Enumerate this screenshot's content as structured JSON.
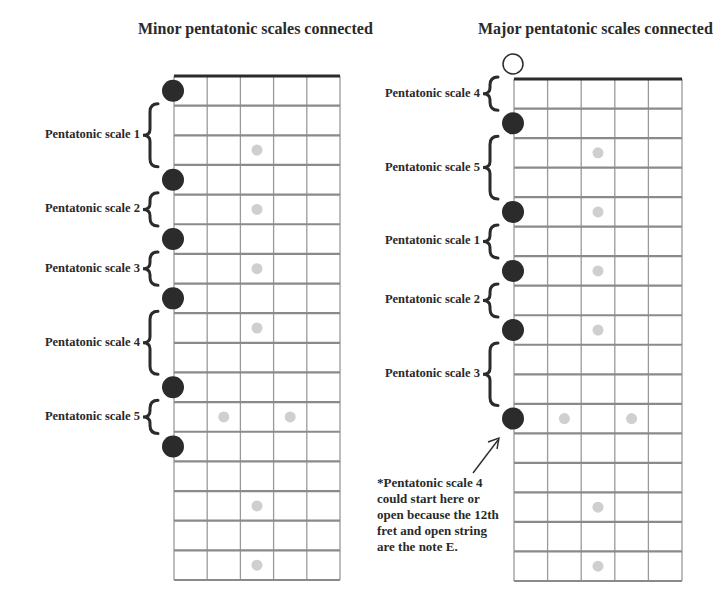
{
  "minor": {
    "title": "Minor pentatonic scales connected",
    "labels": [
      {
        "text": "Pentatonic scale 1",
        "from_fret": 1,
        "to_fret": 4
      },
      {
        "text": "Pentatonic scale 2",
        "from_fret": 4,
        "to_fret": 6
      },
      {
        "text": "Pentatonic scale 3",
        "from_fret": 6,
        "to_fret": 8
      },
      {
        "text": "Pentatonic scale 4",
        "from_fret": 8,
        "to_fret": 11
      },
      {
        "text": "Pentatonic scale 5",
        "from_fret": 11,
        "to_fret": 13
      }
    ],
    "root_frets": [
      1,
      4,
      6,
      8,
      11,
      13
    ],
    "open_root": false
  },
  "major": {
    "title": "Major pentatonic scales connected",
    "labels": [
      {
        "text": "Pentatonic scale 4",
        "from_fret": 0,
        "to_fret": 2
      },
      {
        "text": "Pentatonic scale 5",
        "from_fret": 2,
        "to_fret": 5
      },
      {
        "text": "Pentatonic scale 1",
        "from_fret": 5,
        "to_fret": 7
      },
      {
        "text": "Pentatonic scale 2",
        "from_fret": 7,
        "to_fret": 9
      },
      {
        "text": "Pentatonic scale 3",
        "from_fret": 9,
        "to_fret": 12
      }
    ],
    "root_frets": [
      2,
      5,
      7,
      9,
      12
    ],
    "open_root": true,
    "note": "*Pentatonic scale 4 could start here or open because the 12th fret and open string are the note E."
  },
  "fretboard": {
    "strings": 6,
    "frets": 17,
    "inlay_frets": [
      3,
      5,
      7,
      9,
      15,
      17
    ],
    "double_inlay_frets": [
      12
    ],
    "colors": {
      "root_dot": "#2b2b2b",
      "inlay_dot": "#cfcfcf",
      "fret_line": "#8a8a8a",
      "nut": "#2b2b2b",
      "string_line": "#9a9a9a"
    }
  }
}
